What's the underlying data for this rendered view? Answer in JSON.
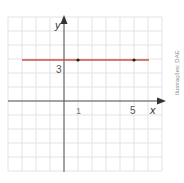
{
  "chart_data": {
    "type": "line",
    "title": "",
    "xlabel": "x",
    "ylabel": "y",
    "xlim": [
      -4,
      7
    ],
    "ylim": [
      -5,
      6
    ],
    "grid": true,
    "series": [
      {
        "name": "y = 3",
        "x": [
          -4,
          7
        ],
        "y": [
          3,
          3
        ],
        "color": "#d9534f"
      }
    ],
    "points": [
      {
        "x": 1,
        "y": 3
      },
      {
        "x": 5,
        "y": 3
      }
    ],
    "tick_labels": {
      "x": [
        "1",
        "5"
      ],
      "y": [
        "3"
      ]
    }
  },
  "labels": {
    "x_axis": "x",
    "y_axis": "y",
    "tick_x1": "1",
    "tick_x5": "5",
    "tick_y3": "3",
    "credit": "Ilustrações: DAE"
  }
}
